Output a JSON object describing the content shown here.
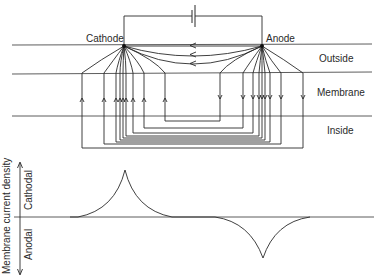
{
  "diagram": {
    "electrodes": {
      "cathode_label": "Cathode",
      "anode_label": "Anode"
    },
    "regions": {
      "outside_label": "Outside",
      "membrane_label": "Membrane",
      "inside_label": "Inside"
    },
    "battery": {
      "symbol": "battery-icon"
    },
    "graph": {
      "y_axis_label": "Membrane current density",
      "upper_label": "Cathodal",
      "lower_label": "Anodal"
    },
    "colors": {
      "ink": "#2a2a2a",
      "background": "#ffffff"
    }
  }
}
